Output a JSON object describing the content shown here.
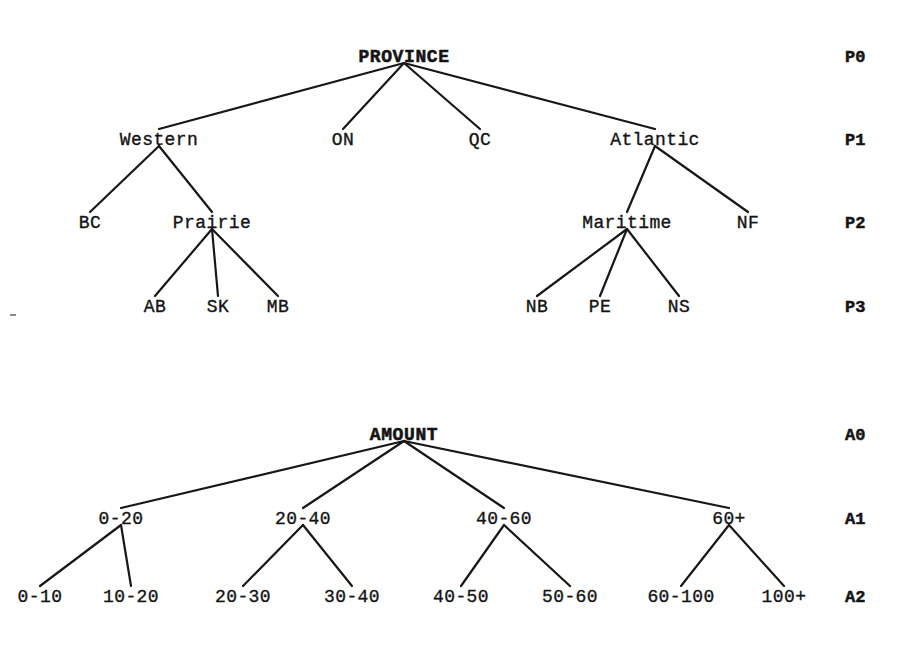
{
  "figure": {
    "background_color": "#ffffff",
    "line_color": "#171717",
    "text_color": "#141414",
    "width": 920,
    "height": 660
  },
  "trees": [
    {
      "id": "province-tree",
      "root_label": "PROVINCE",
      "level_labels": [
        "P0",
        "P1",
        "P2",
        "P3"
      ],
      "level_label_x": 845,
      "level_y": [
        62,
        145,
        228,
        312
      ],
      "nodes": [
        {
          "id": "PROVINCE",
          "label": "PROVINCE",
          "level": 0,
          "x": 404,
          "parent": null,
          "bold": true
        },
        {
          "id": "Western",
          "label": "Western",
          "level": 1,
          "x": 159,
          "parent": "PROVINCE",
          "bold": false
        },
        {
          "id": "ON",
          "label": "ON",
          "level": 1,
          "x": 343,
          "parent": "PROVINCE",
          "bold": false
        },
        {
          "id": "QC",
          "label": "QC",
          "level": 1,
          "x": 480,
          "parent": "PROVINCE",
          "bold": false
        },
        {
          "id": "Atlantic",
          "label": "Atlantic",
          "level": 1,
          "x": 655,
          "parent": "PROVINCE",
          "bold": false
        },
        {
          "id": "BC",
          "label": "BC",
          "level": 2,
          "x": 90,
          "parent": "Western",
          "bold": false
        },
        {
          "id": "Prairie",
          "label": "Prairie",
          "level": 2,
          "x": 212,
          "parent": "Western",
          "bold": false
        },
        {
          "id": "Maritime",
          "label": "Maritime",
          "level": 2,
          "x": 627,
          "parent": "Atlantic",
          "bold": false
        },
        {
          "id": "NF",
          "label": "NF",
          "level": 2,
          "x": 748,
          "parent": "Atlantic",
          "bold": false
        },
        {
          "id": "AB",
          "label": "AB",
          "level": 3,
          "x": 155,
          "parent": "Prairie",
          "bold": false
        },
        {
          "id": "SK",
          "label": "SK",
          "level": 3,
          "x": 218,
          "parent": "Prairie",
          "bold": false
        },
        {
          "id": "MB",
          "label": "MB",
          "level": 3,
          "x": 278,
          "parent": "Prairie",
          "bold": false
        },
        {
          "id": "NB",
          "label": "NB",
          "level": 3,
          "x": 537,
          "parent": "Maritime",
          "bold": false
        },
        {
          "id": "PE",
          "label": "PE",
          "level": 3,
          "x": 600,
          "parent": "Maritime",
          "bold": false
        },
        {
          "id": "NS",
          "label": "NS",
          "level": 3,
          "x": 679,
          "parent": "Maritime",
          "bold": false
        }
      ]
    },
    {
      "id": "amount-tree",
      "root_label": "AMOUNT",
      "level_labels": [
        "A0",
        "A1",
        "A2"
      ],
      "level_label_x": 845,
      "level_y": [
        440,
        524,
        602
      ],
      "nodes": [
        {
          "id": "AMOUNT",
          "label": "AMOUNT",
          "level": 0,
          "x": 404,
          "parent": null,
          "bold": true
        },
        {
          "id": "0-20",
          "label": "0-20",
          "level": 1,
          "x": 121,
          "parent": "AMOUNT",
          "bold": false
        },
        {
          "id": "20-40",
          "label": "20-40",
          "level": 1,
          "x": 303,
          "parent": "AMOUNT",
          "bold": false
        },
        {
          "id": "40-60",
          "label": "40-60",
          "level": 1,
          "x": 504,
          "parent": "AMOUNT",
          "bold": false
        },
        {
          "id": "60+",
          "label": "60+",
          "level": 1,
          "x": 729,
          "parent": "AMOUNT",
          "bold": false
        },
        {
          "id": "0-10",
          "label": "0-10",
          "level": 2,
          "x": 40,
          "parent": "0-20",
          "bold": false
        },
        {
          "id": "10-20",
          "label": "10-20",
          "level": 2,
          "x": 131,
          "parent": "0-20",
          "bold": false
        },
        {
          "id": "20-30",
          "label": "20-30",
          "level": 2,
          "x": 243,
          "parent": "20-40",
          "bold": false
        },
        {
          "id": "30-40",
          "label": "30-40",
          "level": 2,
          "x": 352,
          "parent": "20-40",
          "bold": false
        },
        {
          "id": "40-50",
          "label": "40-50",
          "level": 2,
          "x": 461,
          "parent": "40-60",
          "bold": false
        },
        {
          "id": "50-60",
          "label": "50-60",
          "level": 2,
          "x": 570,
          "parent": "40-60",
          "bold": false
        },
        {
          "id": "60-100",
          "label": "60-100",
          "level": 2,
          "x": 681,
          "parent": "60+",
          "bold": false
        },
        {
          "id": "100+",
          "label": "100+",
          "level": 2,
          "x": 784,
          "parent": "60+",
          "bold": false
        }
      ]
    }
  ],
  "artifacts": [
    {
      "id": "speck-left",
      "x": 10,
      "y": 314,
      "w": 6,
      "h": 2
    }
  ]
}
